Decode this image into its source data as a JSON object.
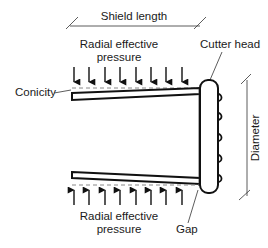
{
  "diagram": {
    "labels": {
      "shield_length": "Shield length",
      "radial_top_line1": "Radial effective",
      "radial_top_line2": "pressure",
      "cutter_head": "Cutter head",
      "conicity": "Conicity",
      "diameter": "Diameter",
      "radial_bottom_line1": "Radial effective",
      "radial_bottom_line2": "pressure",
      "gap": "Gap"
    },
    "arrows": {
      "top_count": 8,
      "bottom_count": 8,
      "top_direction": "down",
      "bottom_direction": "up"
    },
    "colors": {
      "line": "#111111",
      "dashed": "#888888",
      "text": "#1a1a1a",
      "background": "#ffffff"
    }
  }
}
